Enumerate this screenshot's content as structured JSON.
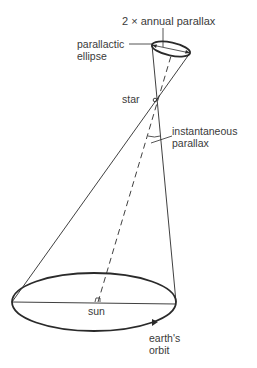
{
  "diagram": {
    "type": "stellar parallax geometry",
    "labels": {
      "annual_parallax": "2 × annual parallax",
      "parallactic_ellipse_line1": "parallactic",
      "parallactic_ellipse_line2": "ellipse",
      "star": "star",
      "instantaneous_parallax_line1": "instantaneous",
      "instantaneous_parallax_line2": "parallax",
      "sun": "sun",
      "earths_orbit_line1": "earth's",
      "earths_orbit_line2": "orbit"
    },
    "colors": {
      "stroke": "#2a2a2a",
      "text": "#3a3a3a",
      "background": "#ffffff"
    }
  }
}
